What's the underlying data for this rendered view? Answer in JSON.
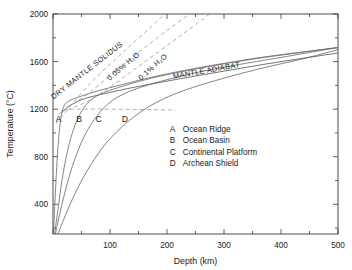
{
  "chart_data": {
    "type": "line",
    "title": "",
    "xlabel": "Depth (km)",
    "ylabel": "Temperature (°C)",
    "xlim": [
      0,
      500
    ],
    "ylim": [
      150,
      2000
    ],
    "grid": false,
    "legend_position": "inside-lower-right",
    "xticks": [
      0,
      100,
      200,
      300,
      400,
      500
    ],
    "xtick_labels": [
      "",
      "100",
      "200",
      "300",
      "400",
      "500"
    ],
    "xminor_ticks": [
      50,
      150,
      250,
      350,
      450
    ],
    "yticks": [
      400,
      800,
      1200,
      1600,
      2000
    ],
    "ytick_labels": [
      "400",
      "800",
      "1200",
      "1600",
      "2000"
    ],
    "yminor_ticks": [
      200,
      600,
      1000,
      1400,
      1800
    ],
    "series": [
      {
        "name": "A",
        "label": "Ocean Ridge",
        "style": "solid",
        "points": [
          [
            0,
            60
          ],
          [
            4,
            480
          ],
          [
            8,
            830
          ],
          [
            12,
            1060
          ],
          [
            16,
            1180
          ],
          [
            20,
            1235
          ],
          [
            26,
            1262
          ],
          [
            35,
            1285
          ],
          [
            50,
            1310
          ],
          [
            80,
            1355
          ],
          [
            120,
            1405
          ],
          [
            170,
            1465
          ],
          [
            230,
            1525
          ],
          [
            300,
            1585
          ],
          [
            380,
            1645
          ],
          [
            500,
            1718
          ]
        ]
      },
      {
        "name": "B",
        "label": "Ocean Basin",
        "style": "solid",
        "points": [
          [
            0,
            50
          ],
          [
            8,
            330
          ],
          [
            16,
            610
          ],
          [
            26,
            860
          ],
          [
            36,
            1030
          ],
          [
            46,
            1145
          ],
          [
            56,
            1225
          ],
          [
            66,
            1275
          ],
          [
            78,
            1315
          ],
          [
            92,
            1345
          ],
          [
            115,
            1382
          ],
          [
            150,
            1432
          ],
          [
            200,
            1490
          ],
          [
            270,
            1555
          ],
          [
            350,
            1620
          ],
          [
            440,
            1680
          ],
          [
            500,
            1718
          ]
        ]
      },
      {
        "name": "C",
        "label": "Continental Platform",
        "style": "solid",
        "points": [
          [
            0,
            45
          ],
          [
            10,
            280
          ],
          [
            22,
            520
          ],
          [
            34,
            720
          ],
          [
            48,
            900
          ],
          [
            62,
            1035
          ],
          [
            76,
            1135
          ],
          [
            90,
            1215
          ],
          [
            104,
            1272
          ],
          [
            120,
            1318
          ],
          [
            140,
            1360
          ],
          [
            170,
            1408
          ],
          [
            210,
            1460
          ],
          [
            260,
            1516
          ],
          [
            320,
            1570
          ],
          [
            400,
            1635
          ],
          [
            500,
            1718
          ]
        ]
      },
      {
        "name": "D",
        "label": "Archean Shield",
        "style": "solid",
        "points": [
          [
            0,
            40
          ],
          [
            14,
            215
          ],
          [
            30,
            400
          ],
          [
            48,
            580
          ],
          [
            68,
            745
          ],
          [
            90,
            895
          ],
          [
            112,
            1010
          ],
          [
            134,
            1105
          ],
          [
            158,
            1190
          ],
          [
            182,
            1258
          ],
          [
            210,
            1320
          ],
          [
            245,
            1382
          ],
          [
            285,
            1440
          ],
          [
            330,
            1500
          ],
          [
            385,
            1565
          ],
          [
            440,
            1625
          ],
          [
            500,
            1700
          ]
        ]
      },
      {
        "name": "MANTLE ADIABAT",
        "label": "MANTLE ADIABAT",
        "style": "solid",
        "points": [
          [
            14,
            1165
          ],
          [
            25,
            1215
          ],
          [
            40,
            1258
          ],
          [
            60,
            1295
          ],
          [
            90,
            1330
          ],
          [
            130,
            1372
          ],
          [
            180,
            1418
          ],
          [
            240,
            1470
          ],
          [
            310,
            1528
          ],
          [
            390,
            1592
          ],
          [
            500,
            1672
          ]
        ]
      },
      {
        "name": "DRY MANTLE SOLIDUS",
        "label": "DRY MANTLE SOLIDUS",
        "style": "dashed",
        "points": [
          [
            6,
            1080
          ],
          [
            60,
            1390
          ],
          [
            120,
            1665
          ],
          [
            175,
            1905
          ],
          [
            196,
            2000
          ]
        ]
      },
      {
        "name": "0.05% H2O",
        "label": "0.05% H₂O",
        "style": "dashed",
        "points": [
          [
            14,
            1180
          ],
          [
            60,
            1325
          ],
          [
            130,
            1600
          ],
          [
            200,
            1862
          ],
          [
            240,
            2000
          ]
        ]
      },
      {
        "name": "0.1% H2O",
        "label": "0.1% H₂O",
        "style": "dashed",
        "points": [
          [
            14,
            1175
          ],
          [
            70,
            1290
          ],
          [
            150,
            1560
          ],
          [
            230,
            1840
          ],
          [
            275,
            2000
          ]
        ]
      },
      {
        "name": "wet solidus plateau",
        "label": "",
        "style": "dashed",
        "points": [
          [
            8,
            1150
          ],
          [
            20,
            1192
          ],
          [
            40,
            1200
          ],
          [
            80,
            1200
          ],
          [
            130,
            1198
          ],
          [
            180,
            1195
          ],
          [
            215,
            1192
          ]
        ]
      }
    ],
    "curve_labels": [
      {
        "text": "DRY MANTLE SOLIDUS",
        "x": 62,
        "y": 1510,
        "rotation": -38
      },
      {
        "text": "0.05% H₂O",
        "x": 126,
        "y": 1545,
        "rotation": -40
      },
      {
        "text": "0.1% H₂O",
        "x": 178,
        "y": 1540,
        "rotation": -41
      },
      {
        "text": "MANTLE ADIABAT",
        "x": 270,
        "y": 1505,
        "rotation": -10
      }
    ],
    "point_labels": [
      {
        "text": "A",
        "x": 10,
        "y": 1090
      },
      {
        "text": "B",
        "x": 46,
        "y": 1090
      },
      {
        "text": "C",
        "x": 80,
        "y": 1090
      },
      {
        "text": "D",
        "x": 126,
        "y": 1090
      }
    ],
    "legend": [
      {
        "key": "A",
        "text": "Ocean Ridge"
      },
      {
        "key": "B",
        "text": "Ocean Basin"
      },
      {
        "key": "C",
        "text": "Continental Platform"
      },
      {
        "key": "D",
        "text": "Archean Shield"
      }
    ]
  }
}
